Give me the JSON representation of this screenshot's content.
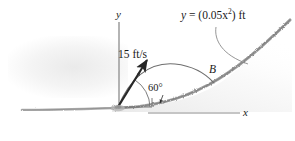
{
  "figure": {
    "type": "engineering-mechanics-diagram",
    "labels": {
      "curve_equation_prefix": "y",
      "curve_equation_eq": "=",
      "curve_equation_body": "(0.05x",
      "curve_equation_exp": "2",
      "curve_equation_suffix": ") ft",
      "speed": "15 ft/s",
      "angle": "60°",
      "point_b": "B",
      "axis_y": "y",
      "axis_x": "x"
    },
    "values": {
      "initial_speed": 15,
      "speed_units": "ft/s",
      "launch_angle_deg": 60,
      "parabola_coefficient": 0.05,
      "parabola_units": "ft"
    },
    "colors": {
      "ink": "#1a1a1a",
      "axis": "#8c8c8c",
      "trajectory": "#6e6e6e",
      "hill": "#9a9a9a",
      "ground": "#a6a6a6",
      "arrow": "#262626",
      "leader": "#8a8a8a",
      "background": "#ffffff"
    }
  }
}
